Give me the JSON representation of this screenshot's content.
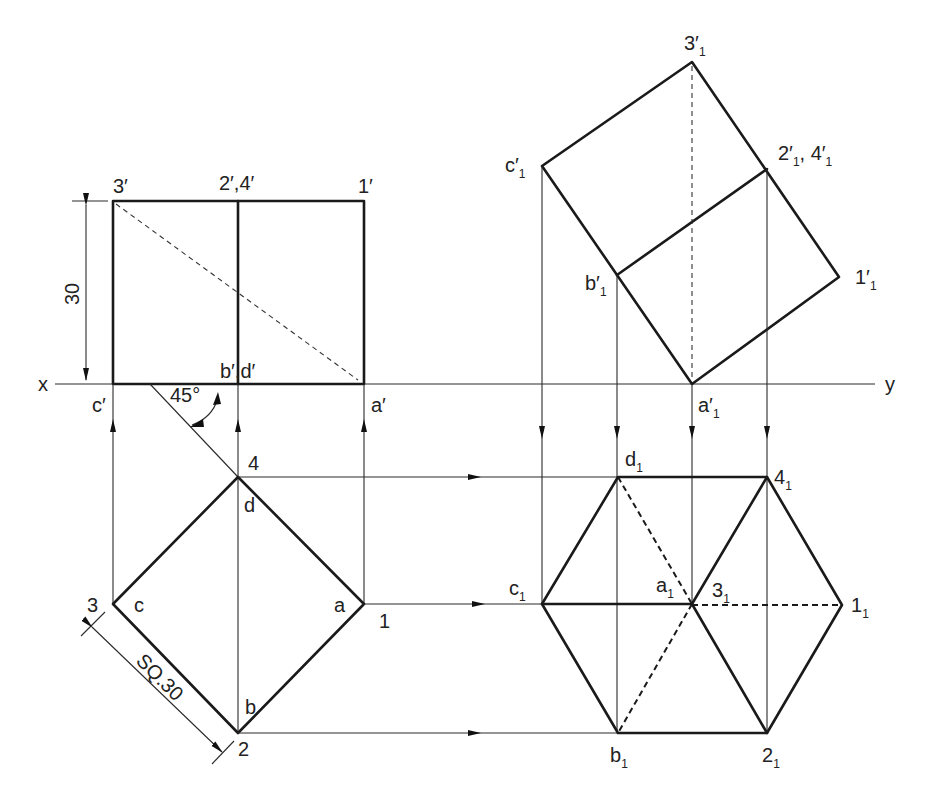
{
  "figure": {
    "type": "orthographic-projection",
    "reference_line": {
      "left_label": "x",
      "right_label": "y"
    },
    "front_view": {
      "labels": {
        "top_left": "3′",
        "top_mid": "2′,4′",
        "top_right": "1′",
        "bottom_mid": "b′,d′",
        "bottom_left": "c′",
        "bottom_right": "a′"
      },
      "dimension_height": "30",
      "angle": "45°"
    },
    "top_view": {
      "labels": {
        "top": "4",
        "top_inner": "d",
        "left": "3",
        "left_inner": "c",
        "right": "1",
        "right_inner": "a",
        "bottom": "2",
        "bottom_inner": "b"
      },
      "dimension_side": "SQ.30"
    },
    "auxiliary_front_view": {
      "labels": {
        "top": {
          "base": "3′",
          "sub": "1"
        },
        "upper_left": {
          "base": "c′",
          "sub": "1"
        },
        "upper_right": {
          "base": "2′",
          "sub": "1",
          "extra_base": ", 4′",
          "extra_sub": "1"
        },
        "mid_left": {
          "base": "b′",
          "sub": "1"
        },
        "right": {
          "base": "1′",
          "sub": "1"
        },
        "bottom": {
          "base": "a′",
          "sub": "1"
        }
      }
    },
    "auxiliary_top_view": {
      "labels": {
        "top_left": {
          "base": "d",
          "sub": "1"
        },
        "top_right": {
          "base": "4",
          "sub": "1"
        },
        "left": {
          "base": "c",
          "sub": "1"
        },
        "center_left": {
          "base": "a",
          "sub": "1"
        },
        "center_right": {
          "base": "3",
          "sub": "1"
        },
        "right": {
          "base": "1",
          "sub": "1"
        },
        "bottom_left": {
          "base": "b",
          "sub": "1"
        },
        "bottom_right": {
          "base": "2",
          "sub": "1"
        }
      }
    },
    "colors": {
      "line": "#1a1a1a",
      "background": "#ffffff"
    }
  }
}
